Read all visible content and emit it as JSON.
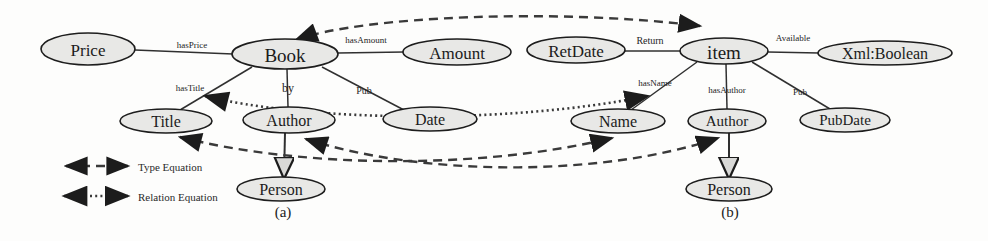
{
  "figure": {
    "caption_a": "(a)",
    "caption_b": "(b)"
  },
  "legend": {
    "items": [
      {
        "label": "Type Equation",
        "style": "dashed",
        "arrows": "double"
      },
      {
        "label": "Relation  Equation",
        "style": "dotted",
        "arrows": "double"
      }
    ]
  },
  "diagram_a": {
    "nodes": [
      {
        "id": "price",
        "label": "Price",
        "cx": 88,
        "cy": 49,
        "rx": 47,
        "ry": 16,
        "fs": 17
      },
      {
        "id": "book",
        "label": "Book",
        "cx": 285,
        "cy": 54,
        "rx": 53,
        "ry": 15,
        "fs": 19
      },
      {
        "id": "amount",
        "label": "Amount",
        "cx": 457,
        "cy": 52,
        "rx": 54,
        "ry": 13,
        "fs": 17
      },
      {
        "id": "title",
        "label": "Title",
        "cx": 166,
        "cy": 121,
        "rx": 46,
        "ry": 12,
        "fs": 16
      },
      {
        "id": "author",
        "label": "Author",
        "cx": 289,
        "cy": 120,
        "rx": 46,
        "ry": 13,
        "fs": 16
      },
      {
        "id": "date",
        "label": "Date",
        "cx": 430,
        "cy": 119,
        "rx": 47,
        "ry": 12,
        "fs": 16
      },
      {
        "id": "person",
        "label": "Person",
        "cx": 281,
        "cy": 189,
        "rx": 44,
        "ry": 12,
        "fs": 16
      }
    ],
    "edges": [
      {
        "id": "hasPrice",
        "label": "hasPrice",
        "lx": 192,
        "ly": 45,
        "fs": 9
      },
      {
        "id": "hasAmount",
        "label": "hasAmount",
        "lx": 366,
        "ly": 40,
        "fs": 9
      },
      {
        "id": "hasTitle",
        "label": "hasTitle",
        "lx": 190,
        "ly": 88,
        "fs": 9
      },
      {
        "id": "by",
        "label": "by",
        "lx": 288,
        "ly": 88,
        "fs": 12
      },
      {
        "id": "pub",
        "label": "Pub",
        "lx": 364,
        "ly": 90,
        "fs": 10
      }
    ]
  },
  "diagram_b": {
    "nodes": [
      {
        "id": "retdate",
        "label": "RetDate",
        "cx": 576,
        "cy": 50,
        "rx": 49,
        "ry": 13,
        "fs": 17
      },
      {
        "id": "item",
        "label": "item",
        "cx": 724,
        "cy": 51,
        "rx": 44,
        "ry": 13,
        "fs": 19
      },
      {
        "id": "xmlboolean",
        "label": "Xml:Boolean",
        "cx": 885,
        "cy": 53,
        "rx": 67,
        "ry": 12,
        "fs": 16
      },
      {
        "id": "name",
        "label": "Name",
        "cx": 618,
        "cy": 121,
        "rx": 47,
        "ry": 12,
        "fs": 16
      },
      {
        "id": "author_b",
        "label": "Author",
        "cx": 727,
        "cy": 121,
        "rx": 39,
        "ry": 12,
        "fs": 15
      },
      {
        "id": "pubdate",
        "label": "PubDate",
        "cx": 845,
        "cy": 120,
        "rx": 45,
        "ry": 12,
        "fs": 15
      },
      {
        "id": "person_b",
        "label": "Person",
        "cx": 729,
        "cy": 189,
        "rx": 43,
        "ry": 12,
        "fs": 16
      }
    ],
    "edges": [
      {
        "id": "return",
        "label": "Return",
        "lx": 650,
        "ly": 40,
        "fs": 10
      },
      {
        "id": "available",
        "label": "Available",
        "lx": 793,
        "ly": 38,
        "fs": 9
      },
      {
        "id": "hasName",
        "label": "hasName",
        "lx": 655,
        "ly": 83,
        "fs": 9
      },
      {
        "id": "hasAuthor",
        "label": "hasAuthor",
        "lx": 727,
        "ly": 90,
        "fs": 9
      },
      {
        "id": "pub_b",
        "label": "Pub",
        "lx": 800,
        "ly": 92,
        "fs": 9
      }
    ]
  },
  "colors": {
    "node_fill": "#e8e8e6",
    "node_stroke": "#1d1d1d",
    "edge": "#303030",
    "equation_edge": "#3a3a3a",
    "text": "#1b1b1b",
    "background": "#fdfdfc"
  }
}
